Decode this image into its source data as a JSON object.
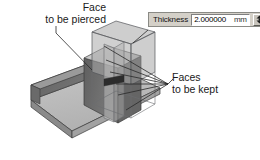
{
  "canvas": {
    "width": 260,
    "height": 160,
    "background": "#ffffff"
  },
  "annotations": [
    {
      "name": "face-to-be-pierced",
      "line1": "Face",
      "line2": "to be pierced"
    },
    {
      "name": "faces-to-be-kept",
      "line1": "Faces",
      "line2": "to be kept"
    }
  ],
  "labels": {
    "pierced_line1": "Face",
    "pierced_line2": "to be pierced",
    "kept_line1": "Faces",
    "kept_line2": "to be kept"
  },
  "thickness_dialog": {
    "label": "Thickness",
    "value": "2.000000",
    "unit": "mm",
    "spinner_icon": "spinner-up-down-icon"
  },
  "model": {
    "type": "sheet-metal-angle-bracket",
    "colors": {
      "top_face": "#c9c9c9",
      "light_face": "#b9b9b9",
      "dark_face": "#6e6e6e",
      "mid_face": "#8e8e8e",
      "shadow_face": "#5a5a5a",
      "edge": "#3a3a3a",
      "transparent_fill": "#a6a6a6"
    }
  }
}
